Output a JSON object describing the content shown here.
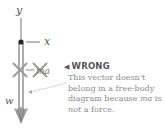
{
  "diagram": {
    "axes": {
      "y_label": "y",
      "x_label": "x"
    },
    "vectors": [
      {
        "label": "w",
        "direction": "down",
        "color": "#9a9a9a"
      },
      {
        "label": "ma",
        "direction": "left",
        "crossed_out": true,
        "color": "#9a9a9a"
      }
    ],
    "annotation": {
      "marker": "◀",
      "title": "WRONG",
      "text_part1": "This vector doesn't belong in a free-body diagram because ",
      "text_ma": "ma",
      "text_part2": " is ",
      "text_not": "not",
      "text_part3": " a force.",
      "title_color": "#555555",
      "text_color": "#8a8a8a"
    }
  }
}
